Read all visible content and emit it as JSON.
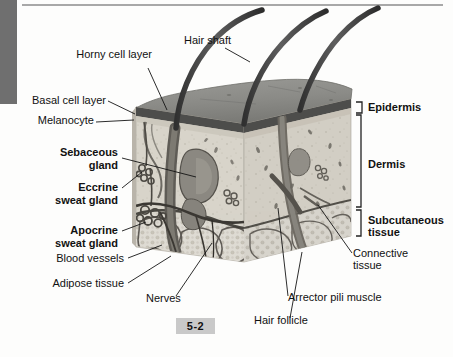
{
  "figure": {
    "number": "5-2"
  },
  "layers": [
    {
      "name": "Epidermis",
      "label": "Epidermis"
    },
    {
      "name": "Dermis",
      "label": "Dermis"
    },
    {
      "name": "Subcutaneous tissue",
      "label": "Subcutaneous\ntissue"
    }
  ],
  "labels_left": [
    {
      "key": "horny-cell-layer",
      "text": "Horny cell layer",
      "bold": false
    },
    {
      "key": "basal-cell-layer",
      "text": "Basal cell layer",
      "bold": false
    },
    {
      "key": "melanocyte",
      "text": "Melanocyte",
      "bold": false
    },
    {
      "key": "sebaceous-gland",
      "text": "Sebaceous\ngland",
      "bold": true
    },
    {
      "key": "eccrine-sweat-gland",
      "text": "Eccrine\nsweat gland",
      "bold": true
    },
    {
      "key": "apocrine-sweat-gland",
      "text": "Apocrine\nsweat gland",
      "bold": true
    },
    {
      "key": "blood-vessels",
      "text": "Blood vessels",
      "bold": false
    },
    {
      "key": "adipose-tissue",
      "text": "Adipose tissue",
      "bold": false
    }
  ],
  "labels_other": [
    {
      "key": "hair-shaft",
      "text": "Hair shaft"
    },
    {
      "key": "nerves",
      "text": "Nerves"
    },
    {
      "key": "hair-follicle",
      "text": "Hair follicle"
    },
    {
      "key": "arrector-pili-muscle",
      "text": "Arrector pili muscle"
    },
    {
      "key": "connective-tissue",
      "text": "Connective\ntissue"
    }
  ],
  "text": {
    "horny_cell_layer": "Horny cell layer",
    "basal_cell_layer": "Basal cell layer",
    "melanocyte": "Melanocyte",
    "sebaceous_gland_l1": "Sebaceous",
    "sebaceous_gland_l2": "gland",
    "eccrine_l1": "Eccrine",
    "eccrine_l2": "sweat gland",
    "apocrine_l1": "Apocrine",
    "apocrine_l2": "sweat gland",
    "blood_vessels": "Blood vessels",
    "adipose_tissue": "Adipose tissue",
    "hair_shaft": "Hair shaft",
    "nerves": "Nerves",
    "hair_follicle": "Hair follicle",
    "arrector_pili_muscle": "Arrector pili muscle",
    "connective_l1": "Connective",
    "connective_l2": "tissue",
    "epidermis": "Epidermis",
    "dermis": "Dermis",
    "subcutaneous_l1": "Subcutaneous",
    "subcutaneous_l2": "tissue",
    "figure_number": "5-2"
  },
  "colors": {
    "page_background": "#fdfdfc",
    "left_bar": "#6f6f6f",
    "top_rule": "#a8a8a8",
    "label_text": "#111111",
    "leader_line": "#1a1a1a",
    "figure_box": "#c9c9c9",
    "epidermis_surface": "#8c8c8c",
    "epidermis_band": "#555555",
    "dermis_fill": "#d6d2c9",
    "dermis_right": "#cfcbc1",
    "subcutaneous_fill": "#cdc9c0",
    "hair_shaft": "#4a4a4a",
    "structure_dark": "#3a3a3a",
    "bracket": "#2a2a2a"
  }
}
